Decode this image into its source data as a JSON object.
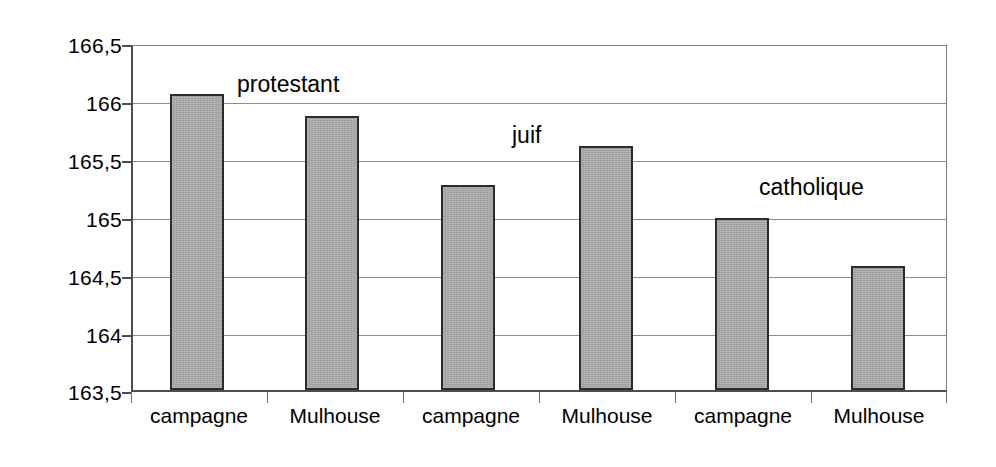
{
  "chart_data": {
    "type": "bar",
    "title": "",
    "subtitle": "",
    "xlabel": "",
    "ylabel": "",
    "categories": [
      "campagne",
      "Mulhouse",
      "campagne",
      "Mulhouse",
      "campagne",
      "Mulhouse"
    ],
    "values": [
      166.08,
      165.89,
      165.29,
      165.63,
      165.0,
      164.58
    ],
    "ylim": [
      163.5,
      166.5
    ],
    "ytick_labels": [
      "166,5",
      "166",
      "165,5",
      "165",
      "164,5",
      "164",
      "163,5"
    ],
    "ytick_values": [
      166.5,
      166,
      165.5,
      165,
      164.5,
      164,
      163.5
    ],
    "grid": true,
    "legend": "none",
    "annotations": [
      {
        "text": "protestant",
        "covers": [
          0,
          1
        ]
      },
      {
        "text": "juif",
        "covers": [
          2,
          3
        ]
      },
      {
        "text": "catholique",
        "covers": [
          4,
          5
        ]
      }
    ],
    "series": [
      {
        "name": "taille moyenne",
        "values": [
          166.08,
          165.89,
          165.29,
          165.63,
          165.0,
          164.58
        ]
      }
    ],
    "colors": {
      "bar_fill": "#a9a9a9",
      "bar_border": "#2b2b2b",
      "gridline": "#8c8c8c",
      "axis": "#4d4d4d",
      "text": "#000000",
      "background": "#ffffff"
    }
  }
}
